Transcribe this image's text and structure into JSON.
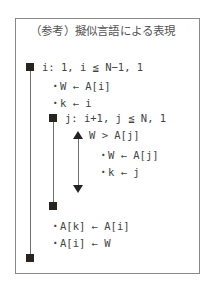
{
  "title": "（参考）擬似言語による表現",
  "outer_loop": {
    "header": "i: 1, i ≦ N−1, 1",
    "pre_statements": [
      "・W ← A[i]",
      "・k ← i"
    ],
    "post_statements": [
      "・A[k] ← A[i]",
      "・A[i] ← W"
    ]
  },
  "inner_loop": {
    "header": "j: i+1, j ≦ N, 1",
    "condition": "W > A[j]",
    "branch_statements": [
      "・W ← A[j]",
      "・k ← j"
    ]
  },
  "icons": {
    "loop_marker": "black-square",
    "selection_marker_top": "triangle-up",
    "selection_marker_bottom": "triangle-down"
  },
  "colors": {
    "border": "#8a8a8a",
    "marker": "#2a2421",
    "text": "#444444"
  }
}
